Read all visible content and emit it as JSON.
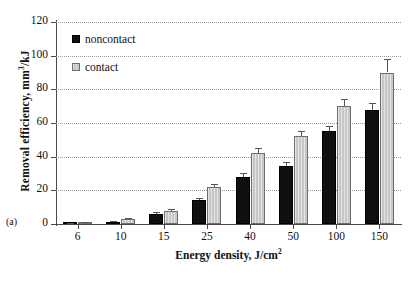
{
  "panel": {
    "label": "(a)"
  },
  "axes": {
    "ylabel_main": "Removal efficiency,  mm",
    "ylabel_sup": "3",
    "ylabel_tail": "/kJ",
    "xlabel_main": "Energy density,  J/cm",
    "xlabel_sup": "2"
  },
  "legend": {
    "items": [
      {
        "label": "noncontact",
        "color": "#101010"
      },
      {
        "label": "contact",
        "color": "#c6c6c6"
      }
    ]
  },
  "chart_data": {
    "type": "bar",
    "title": "",
    "xlabel": "Energy density,  J/cm2",
    "ylabel": "Removal efficiency,  mm3/kJ",
    "categories": [
      "6",
      "10",
      "15",
      "25",
      "40",
      "50",
      "100",
      "150"
    ],
    "ylim": [
      0,
      120
    ],
    "yticks": [
      0,
      20,
      40,
      60,
      80,
      100,
      120
    ],
    "grid": "horizontal-dotted",
    "legend_position": "top-left-inside",
    "series": [
      {
        "name": "noncontact",
        "color": "#101010",
        "values": [
          0.3,
          1.2,
          6.0,
          14.0,
          28.0,
          34.5,
          55.0,
          68.0
        ],
        "errors": [
          0.3,
          0.5,
          1.0,
          1.5,
          2.5,
          2.5,
          3.5,
          4.0
        ]
      },
      {
        "name": "contact",
        "color": "#c6c6c6",
        "values": [
          0.8,
          3.0,
          7.5,
          22.0,
          42.0,
          52.0,
          70.0,
          90.0
        ],
        "errors": [
          0.4,
          0.6,
          1.2,
          2.0,
          3.0,
          3.0,
          4.5,
          8.0
        ]
      }
    ]
  }
}
